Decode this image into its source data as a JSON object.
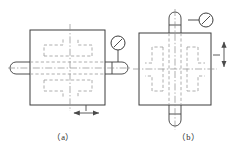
{
  "figure": {
    "type": "engineering-drawing",
    "background": "#ffffff",
    "stroke_solid": "#3c3c3c",
    "stroke_hidden": "#9a9a9a",
    "stroke_center": "#8c8c8c",
    "stroke_arrow": "#4a4a4a"
  },
  "captions": {
    "a": "（a）",
    "b": "（b）"
  },
  "panel_a": {
    "label": "(a)",
    "description": "Workpiece block with horizontal shaft and dial indicator at upper right; horizontal double-headed motion arrow below the block",
    "block": {
      "x": 30,
      "y": 30,
      "width": 75,
      "height": 75
    },
    "shaft": {
      "orientation": "horizontal",
      "y_center": 68,
      "left_end_x": 10,
      "right_end_x": 128,
      "half_thickness": 6,
      "end_cap": "rounded"
    },
    "indicator": {
      "cx": 118,
      "cy": 43,
      "r": 7,
      "stem_to_y": 62,
      "needle": "diagonal"
    },
    "motion_arrow": {
      "orientation": "horizontal",
      "direction": "double",
      "x1": 72,
      "x2": 101,
      "y": 113,
      "leader_x": 86,
      "leader_y1": 105,
      "leader_y2": 110
    },
    "centerlines": {
      "vertical_x": 70,
      "horizontal_y": 68
    }
  },
  "panel_b": {
    "label": "(b)",
    "description": "Workpiece block with vertical shaft and dial indicator at upper right; vertical double-headed motion arrow at the right side",
    "block": {
      "x": 139,
      "y": 33,
      "width": 72,
      "height": 72
    },
    "shaft": {
      "orientation": "vertical",
      "x_center": 175,
      "top_end_y": 12,
      "bottom_end_y": 128,
      "half_thickness": 6,
      "end_cap": "rounded"
    },
    "indicator": {
      "cx": 206,
      "cy": 20,
      "r": 7,
      "stem_to_x": 188,
      "needle": "diagonal"
    },
    "motion_arrow": {
      "orientation": "vertical",
      "direction": "double",
      "y1": 40,
      "y2": 69,
      "x": 224,
      "leader_y": 55,
      "leader_x1": 211,
      "leader_x2": 219
    },
    "centerlines": {
      "vertical_x": 175,
      "horizontal_y": 69
    }
  }
}
